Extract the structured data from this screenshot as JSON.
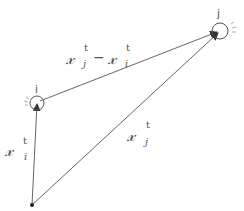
{
  "diagram": {
    "origin": {
      "x": 32,
      "y": 205
    },
    "nodes": [
      {
        "id": "i",
        "label": "i",
        "cx": 37,
        "cy": 103,
        "r": 7
      },
      {
        "id": "j",
        "label": "j",
        "cx": 220,
        "cy": 31,
        "r": 8
      }
    ],
    "edges": [
      {
        "from": "origin",
        "to": "i",
        "label_base": "x",
        "label_sub": "i",
        "label_sup": "t"
      },
      {
        "from": "origin",
        "to": "j",
        "label_base": "x",
        "label_sub": "j",
        "label_sup": "t"
      },
      {
        "from": "i",
        "to": "j",
        "label_text": "x_j^t − x_i^t"
      }
    ],
    "labels": {
      "xi": {
        "base": "𝓍",
        "sub": "i",
        "sup": "t"
      },
      "xj": {
        "base": "𝓍",
        "sub": "j",
        "sup": "t"
      },
      "diff": {
        "base1": "𝓍",
        "sub1": "j",
        "sup1": "t",
        "minus": "−",
        "base2": "𝓍",
        "sub2": "i",
        "sup2": "t"
      }
    },
    "colors": {
      "line": "#666666",
      "text": "#555555",
      "dot": "#222222"
    }
  }
}
